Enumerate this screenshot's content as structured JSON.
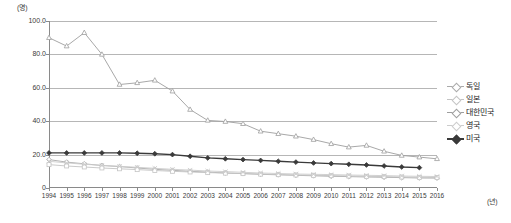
{
  "chart_data": {
    "type": "line",
    "title": "",
    "xlabel": "(년)",
    "ylabel": "(명)",
    "ylim": [
      0,
      100
    ],
    "yticks": [
      "0",
      "20.0",
      "40.0",
      "60.0",
      "80.0",
      "100.0"
    ],
    "grid": true,
    "legend_position": "right",
    "x": [
      "1994",
      "1995",
      "1996",
      "1997",
      "1998",
      "1999",
      "2000",
      "2001",
      "2002",
      "2003",
      "2004",
      "2005",
      "2006",
      "2007",
      "2008",
      "2009",
      "2010",
      "2011",
      "2012",
      "2013",
      "2014",
      "2015",
      "2016"
    ],
    "series": [
      {
        "name": "독일",
        "color": "#aaaaaa",
        "marker": "diamond-open",
        "values": [
          17.0,
          15.5,
          14.5,
          13.5,
          12.8,
          12.0,
          11.2,
          10.6,
          10.0,
          9.5,
          9.0,
          8.6,
          8.2,
          7.9,
          7.6,
          7.3,
          7.0,
          6.8,
          6.6,
          6.4,
          6.2,
          6.0,
          5.9
        ]
      },
      {
        "name": "일본",
        "color": "#c4c4c4",
        "marker": "square-open",
        "values": [
          14.0,
          13.2,
          12.6,
          12.0,
          11.5,
          11.0,
          10.5,
          10.0,
          9.6,
          9.2,
          8.9,
          8.6,
          8.3,
          8.0,
          7.8,
          7.6,
          7.4,
          7.2,
          7.0,
          6.8,
          6.6,
          6.4,
          6.3
        ]
      },
      {
        "name": "대한민국",
        "color": "#9e9e9e",
        "marker": "triangle-open",
        "values": [
          90.0,
          85.0,
          93.0,
          80.0,
          62.0,
          63.0,
          64.5,
          58.0,
          47.0,
          40.5,
          39.8,
          38.5,
          34.0,
          32.5,
          31.0,
          29.0,
          26.5,
          24.5,
          25.5,
          22.0,
          19.5,
          18.5,
          17.5
        ]
      },
      {
        "name": "영국",
        "color": "#cccccc",
        "marker": "cross",
        "values": [
          16.0,
          15.0,
          14.2,
          13.6,
          13.0,
          12.4,
          11.8,
          11.2,
          10.7,
          10.2,
          9.8,
          9.4,
          9.0,
          8.7,
          8.4,
          8.2,
          8.0,
          7.8,
          7.6,
          7.4,
          7.2,
          7.0,
          6.9
        ]
      },
      {
        "name": "미국",
        "color": "#3a3a3a",
        "marker": "diamond-filled",
        "values": [
          21.0,
          21.0,
          21.0,
          21.0,
          21.0,
          20.8,
          20.5,
          20.0,
          19.0,
          18.0,
          17.5,
          17.0,
          16.5,
          16.0,
          15.5,
          15.0,
          14.6,
          14.2,
          13.8,
          13.2,
          12.6,
          12.2,
          null
        ]
      }
    ]
  },
  "axes": {
    "y_unit": "(명)",
    "x_unit": "(년)"
  }
}
